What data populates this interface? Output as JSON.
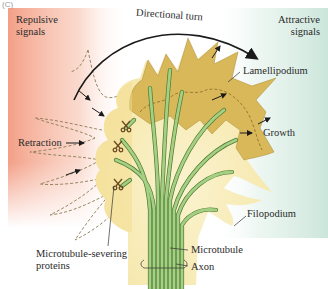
{
  "figure": {
    "panel_label": "(C)",
    "colors": {
      "repulsive_bg": "#f4a48c",
      "attractive_bg": "#cfe6dc",
      "lamellipodium_fill": "#d9b85a",
      "cytoplasm_fill": "#f8edc0",
      "microtubule_fill": "#9cc77a",
      "microtubule_stroke": "#4d7a33",
      "arrow": "#1a1a1a",
      "dashed_outline": "#8a7a55",
      "severing_protein": "#6b4a22"
    }
  },
  "labels": {
    "repulsive_signals": [
      "Repulsive",
      "signals"
    ],
    "attractive_signals": [
      "Attractive",
      "signals"
    ],
    "directional_turn": "Directional turn",
    "lamellipodium": "Lamellipodium",
    "retraction": "Retraction",
    "growth": "Growth",
    "filopodium": "Filopodium",
    "microtubule_severing": [
      "Microtubule-severing",
      "proteins"
    ],
    "microtubule": "Microtubule",
    "axon": "Axon"
  }
}
